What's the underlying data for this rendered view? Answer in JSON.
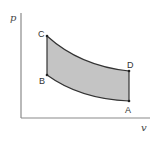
{
  "diagram": {
    "axes": {
      "y_label": "p",
      "x_label": "v",
      "color": "#8a8a8a"
    },
    "points": {
      "A": {
        "label": "A",
        "x": 129,
        "y": 101
      },
      "B": {
        "label": "B",
        "x": 47,
        "y": 75
      },
      "C": {
        "label": "C",
        "x": 47,
        "y": 36
      },
      "D": {
        "label": "D",
        "x": 129,
        "y": 71
      }
    },
    "region": {
      "fill": "#c4c4c4",
      "stroke": "#333333"
    },
    "cycle_paths": [
      {
        "from": "C",
        "to": "D",
        "type": "curve"
      },
      {
        "from": "D",
        "to": "A",
        "type": "line"
      },
      {
        "from": "A",
        "to": "B",
        "type": "curve"
      },
      {
        "from": "B",
        "to": "C",
        "type": "line"
      }
    ]
  }
}
